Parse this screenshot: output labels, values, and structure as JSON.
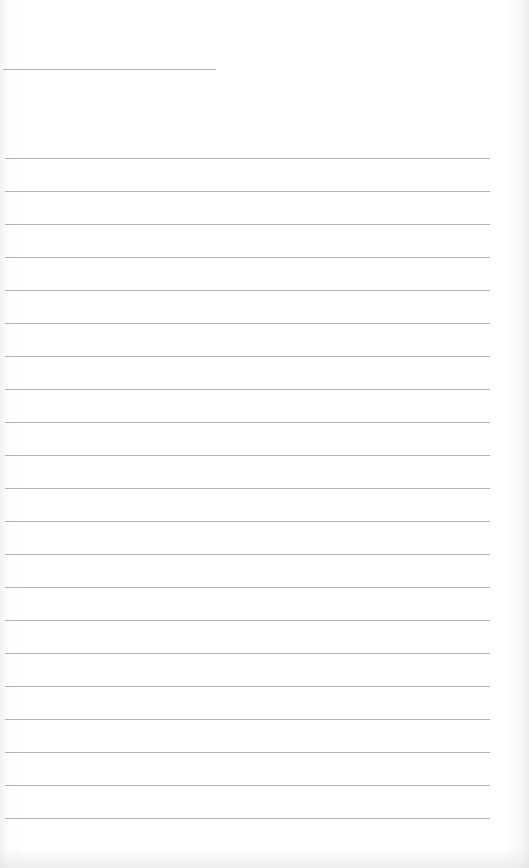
{
  "page": {
    "type": "lined-paper",
    "line_color": "#9a9a9a",
    "background": "#ffffff",
    "header_line": {
      "top": 69,
      "left": 3,
      "width": 213
    },
    "ruled_lines": {
      "first_top": 158,
      "spacing": 33,
      "count": 21,
      "left": 5,
      "width": 485
    }
  }
}
